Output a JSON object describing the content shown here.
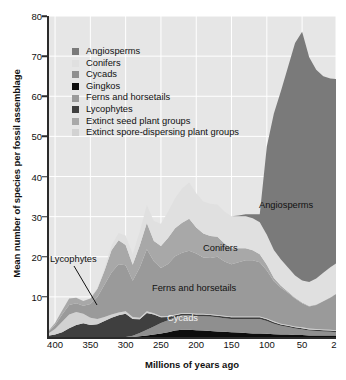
{
  "figure": {
    "ylabel": "Mean number of species per fossil assemblage",
    "xlabel": "Millions of years ago"
  },
  "legend": {
    "items": [
      {
        "label": "Angiosperms",
        "color": "#7a7a7a"
      },
      {
        "label": "Conifers",
        "color": "#e0e0e0"
      },
      {
        "label": "Cycads",
        "color": "#8f8f8f"
      },
      {
        "label": "Gingkos",
        "color": "#0d0d0d"
      },
      {
        "label": "Ferns and horsetails",
        "color": "#9a9a9a"
      },
      {
        "label": "Lycophytes",
        "color": "#3f3f3f"
      },
      {
        "label": "Extinct seed plant groups",
        "color": "#a8a8a8"
      },
      {
        "label": "Extinct spore-dispersing plant groups",
        "color": "#d2d2d2"
      }
    ]
  },
  "annotations": {
    "angiosperms": "Angiosperms",
    "conifers": "Conifers",
    "ferns": "Ferns and horsetails",
    "cycads": "Cycads",
    "lycophytes": "Lycophytes"
  },
  "axes": {
    "yticks": [
      10,
      20,
      30,
      40,
      50,
      60,
      70,
      80
    ],
    "xticks": [
      400,
      350,
      300,
      250,
      200,
      150,
      100,
      50,
      2
    ]
  },
  "chart_data": {
    "type": "area",
    "title": "",
    "subtitle": "",
    "xlabel": "Millions of years ago",
    "ylabel": "Mean number of species per fossil assemblage",
    "stacked": true,
    "grid": true,
    "legend_position": "inside-top-left",
    "xlim": [
      410,
      2
    ],
    "ylim": [
      0,
      80
    ],
    "x_reversed": true,
    "xticks": [
      400,
      350,
      300,
      250,
      200,
      150,
      100,
      50,
      2
    ],
    "yticks": [
      10,
      20,
      30,
      40,
      50,
      60,
      70,
      80
    ],
    "x": [
      410,
      400,
      390,
      380,
      370,
      360,
      350,
      340,
      330,
      320,
      310,
      300,
      290,
      280,
      270,
      260,
      250,
      240,
      230,
      220,
      210,
      200,
      190,
      180,
      170,
      160,
      150,
      140,
      130,
      120,
      110,
      100,
      90,
      80,
      70,
      60,
      50,
      40,
      30,
      20,
      10,
      2
    ],
    "series": [
      {
        "name": "Gingkos",
        "color": "#0d0d0d",
        "values": [
          0,
          0,
          0,
          0,
          0,
          0,
          0,
          0,
          0,
          0,
          0,
          0,
          0,
          0.2,
          0.4,
          0.6,
          0.9,
          1.2,
          1.6,
          1.8,
          1.8,
          1.7,
          1.6,
          1.5,
          1.4,
          1.3,
          1.2,
          1.1,
          1.0,
          0.9,
          0.9,
          0.8,
          0.7,
          0.6,
          0.6,
          0.5,
          0.5,
          0.4,
          0.4,
          0.4,
          0.4,
          0.4
        ]
      },
      {
        "name": "Cycads",
        "color": "#8f8f8f",
        "values": [
          0,
          0,
          0,
          0,
          0,
          0,
          0,
          0,
          0,
          0,
          0,
          0,
          0.3,
          0.8,
          1.4,
          2.0,
          2.6,
          3.0,
          3.3,
          3.6,
          3.6,
          3.5,
          3.6,
          3.6,
          3.5,
          3.4,
          3.3,
          3.4,
          3.5,
          3.6,
          3.6,
          3.2,
          2.6,
          2.2,
          1.9,
          1.6,
          1.4,
          1.2,
          1.1,
          1.0,
          0.9,
          0.8
        ]
      },
      {
        "name": "Lycophytes",
        "color": "#3f3f3f",
        "values": [
          0.3,
          0.6,
          1.2,
          2.2,
          3.0,
          3.4,
          3.0,
          3.2,
          4.0,
          4.8,
          5.4,
          5.8,
          4.2,
          3.4,
          4.2,
          3.0,
          1.4,
          0.8,
          0.5,
          0.4,
          0.4,
          0.4,
          0.4,
          0.4,
          0.4,
          0.4,
          0.4,
          0.4,
          0.4,
          0.4,
          0.4,
          0.4,
          0.4,
          0.3,
          0.3,
          0.3,
          0.3,
          0.3,
          0.3,
          0.3,
          0.3,
          0.3
        ]
      },
      {
        "name": "Extinct spore-dispersing plant groups",
        "color": "#d2d2d2",
        "values": [
          0.5,
          1.4,
          2.6,
          3.4,
          3.2,
          2.4,
          1.8,
          1.3,
          1.0,
          0.8,
          0.7,
          0.6,
          0.5,
          0.4,
          0.4,
          0.3,
          0.3,
          0.2,
          0.2,
          0.2,
          0.2,
          0.2,
          0.2,
          0.2,
          0.2,
          0.2,
          0.2,
          0.2,
          0.2,
          0.2,
          0.2,
          0.2,
          0.2,
          0.2,
          0.2,
          0.2,
          0.2,
          0.2,
          0.2,
          0.2,
          0.2,
          0.2
        ]
      },
      {
        "name": "Ferns and horsetails",
        "color": "#9a9a9a",
        "values": [
          0.4,
          1.0,
          1.8,
          2.4,
          2.2,
          2.0,
          3.4,
          5.5,
          8.0,
          10.5,
          12.0,
          11.5,
          9.0,
          12.5,
          15.5,
          13.0,
          12.0,
          13.0,
          14.5,
          15.0,
          15.5,
          15.0,
          14.0,
          14.0,
          14.5,
          13.5,
          13.0,
          13.5,
          14.0,
          14.0,
          13.5,
          12.0,
          10.0,
          9.0,
          8.0,
          7.0,
          6.0,
          5.5,
          6.0,
          7.0,
          8.0,
          9.0
        ]
      },
      {
        "name": "Extinct seed plant groups",
        "color": "#a8a8a8",
        "values": [
          0.2,
          0.5,
          1.0,
          1.6,
          1.4,
          1.2,
          1.4,
          2.0,
          3.5,
          5.5,
          6.0,
          5.0,
          4.0,
          5.5,
          6.5,
          5.0,
          5.5,
          6.5,
          7.0,
          7.5,
          8.0,
          6.5,
          6.0,
          5.5,
          5.0,
          4.5,
          4.0,
          3.5,
          3.0,
          2.5,
          2.0,
          1.4,
          0.8,
          0.5,
          0.3,
          0.2,
          0.2,
          0.1,
          0.1,
          0.1,
          0.1,
          0.1
        ]
      },
      {
        "name": "Conifers",
        "color": "#e0e0e0",
        "values": [
          0,
          0,
          0,
          0,
          0,
          0,
          0,
          0.2,
          0.6,
          1.2,
          1.8,
          2.4,
          2.6,
          3.5,
          4.5,
          5.0,
          5.5,
          6.5,
          7.5,
          8.5,
          9.0,
          8.5,
          8.0,
          8.0,
          8.0,
          8.0,
          8.0,
          8.0,
          8.0,
          8.0,
          8.0,
          7.5,
          7.0,
          6.5,
          6.0,
          5.5,
          5.5,
          6.0,
          6.5,
          7.0,
          7.5,
          7.5
        ]
      },
      {
        "name": "Angiosperms",
        "color": "#7a7a7a",
        "values": [
          0,
          0,
          0,
          0,
          0,
          0,
          0,
          0,
          0,
          0,
          0,
          0,
          0,
          0,
          0,
          0,
          0,
          0,
          0,
          0,
          0,
          0,
          0,
          0,
          0,
          0,
          0,
          0.2,
          0.5,
          1.0,
          2.0,
          22.0,
          34.0,
          42.0,
          50.0,
          58.0,
          62.0,
          56.0,
          52.0,
          49.0,
          47.0,
          46.0
        ]
      }
    ]
  }
}
